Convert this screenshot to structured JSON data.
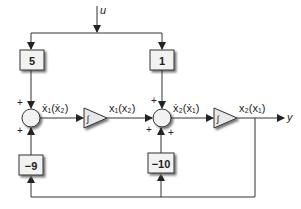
{
  "diagram": {
    "input_label": "u",
    "output_label": "y",
    "gains": {
      "top_left": "5",
      "top_right": "1",
      "bottom_left": "−9",
      "bottom_right": "−10"
    },
    "signals": {
      "sum1_out": "ẋ₁(ẋ₂)",
      "int1_out": "x₁(x₂)",
      "sum2_out": "ẋ₂(ẋ₁)",
      "int2_out": "x₂(x₁)"
    },
    "sum_signs": {
      "sum1_top": "+",
      "sum1_bottom": "+",
      "sum2_top": "+",
      "sum2_left": "+",
      "sum2_bottom": "+"
    },
    "colors": {
      "line": "#333333",
      "block_fill": "#f2f2f2",
      "shadow": "#888888"
    }
  }
}
